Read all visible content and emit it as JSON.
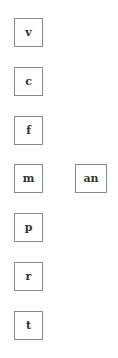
{
  "tiles": {
    "column_left": [
      {
        "label": "v"
      },
      {
        "label": "c"
      },
      {
        "label": "f"
      },
      {
        "label": "m"
      },
      {
        "label": "p"
      },
      {
        "label": "r"
      },
      {
        "label": "t"
      }
    ],
    "column_right": [
      {
        "label": "an"
      }
    ]
  },
  "colors": {
    "border": "#8a8a8a",
    "text": "#333333",
    "background": "#ffffff"
  }
}
